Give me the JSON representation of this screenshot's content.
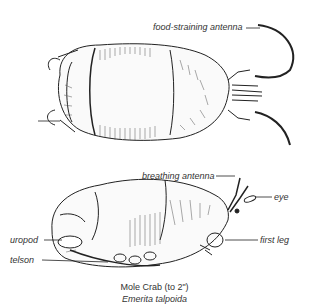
{
  "figure": {
    "labels": {
      "food_antenna": "food-straining antenna",
      "breathing_antenna": "breathing antenna",
      "eye": "eye",
      "uropod": "uropod",
      "first_leg": "first leg",
      "telson": "telson"
    },
    "caption": {
      "common_name": "Mole Crab (to 2\")",
      "scientific_name": "Emerita talpoida"
    }
  }
}
